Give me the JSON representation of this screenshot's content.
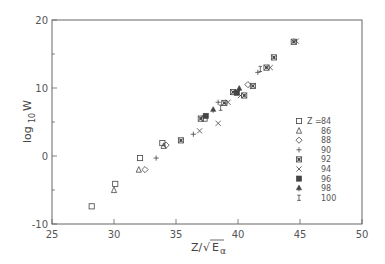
{
  "chart_data": {
    "type": "scatter",
    "title": "",
    "xlabel": "Z/√E_α",
    "ylabel": "log10 W",
    "xlim": [
      25,
      50
    ],
    "ylim": [
      -10,
      20
    ],
    "x_ticks": [
      25,
      30,
      35,
      40,
      45,
      50
    ],
    "y_ticks": [
      -10,
      0,
      10,
      20
    ],
    "x_tick_labels": [
      "25",
      "30",
      "35",
      "40",
      "45",
      "50"
    ],
    "y_tick_labels": [
      "-10",
      "0",
      "10",
      "20"
    ],
    "grid": false,
    "legend_position": "inside-right",
    "legend_title": "Z =",
    "series": [
      {
        "name": "84",
        "marker": "open-square",
        "points": [
          [
            28.2,
            -7.4
          ],
          [
            30.1,
            -4.1
          ],
          [
            32.1,
            -0.3
          ],
          [
            33.9,
            1.9
          ],
          [
            37.3,
            5.5
          ]
        ]
      },
      {
        "name": "86",
        "marker": "open-triangle",
        "points": [
          [
            30.0,
            -5.0
          ],
          [
            32.0,
            -2.0
          ],
          [
            34.0,
            1.5
          ]
        ]
      },
      {
        "name": "88",
        "marker": "open-diamond",
        "points": [
          [
            32.5,
            -2.0
          ],
          [
            34.2,
            1.6
          ],
          [
            40.8,
            10.5
          ]
        ]
      },
      {
        "name": "90",
        "marker": "plus",
        "points": [
          [
            33.4,
            -0.3
          ],
          [
            36.4,
            3.2
          ],
          [
            38.4,
            7.9
          ],
          [
            41.6,
            12.3
          ]
        ]
      },
      {
        "name": "92",
        "marker": "boxed-asterisk",
        "points": [
          [
            35.4,
            2.3
          ],
          [
            37.0,
            5.5
          ],
          [
            38.9,
            7.8
          ],
          [
            39.6,
            9.4
          ],
          [
            40.5,
            8.9
          ],
          [
            41.2,
            10.3
          ],
          [
            42.3,
            13.0
          ],
          [
            42.9,
            14.5
          ],
          [
            44.5,
            16.8
          ]
        ]
      },
      {
        "name": "94",
        "marker": "cross",
        "points": [
          [
            36.9,
            3.7
          ],
          [
            38.4,
            4.8
          ],
          [
            39.2,
            7.9
          ],
          [
            40.2,
            8.9
          ],
          [
            42.6,
            13.0
          ],
          [
            44.7,
            16.9
          ]
        ]
      },
      {
        "name": "96",
        "marker": "filled-square",
        "points": [
          [
            37.4,
            5.9
          ],
          [
            39.9,
            9.3
          ]
        ]
      },
      {
        "name": "98",
        "marker": "filled-triangle",
        "points": [
          [
            38.0,
            6.8
          ],
          [
            40.1,
            9.9
          ]
        ]
      },
      {
        "name": "100",
        "marker": "I-beam",
        "points": [
          [
            38.6,
            7.1
          ],
          [
            41.8,
            12.8
          ]
        ]
      }
    ]
  },
  "legend": {
    "prefix": "Z =",
    "items": [
      {
        "label": "84",
        "marker": "open-square"
      },
      {
        "label": "86",
        "marker": "open-triangle"
      },
      {
        "label": "88",
        "marker": "open-diamond"
      },
      {
        "label": "90",
        "marker": "plus"
      },
      {
        "label": "92",
        "marker": "boxed-asterisk"
      },
      {
        "label": "94",
        "marker": "cross"
      },
      {
        "label": "96",
        "marker": "filled-square"
      },
      {
        "label": "98",
        "marker": "filled-triangle"
      },
      {
        "label": "100",
        "marker": "I-beam"
      }
    ]
  },
  "axes": {
    "xlabel_main": "Z/",
    "xlabel_sqrt": "√",
    "xlabel_E": "E",
    "xlabel_sub": "α",
    "ylabel_main": "log",
    "ylabel_sub": "10",
    "ylabel_var": "W"
  }
}
